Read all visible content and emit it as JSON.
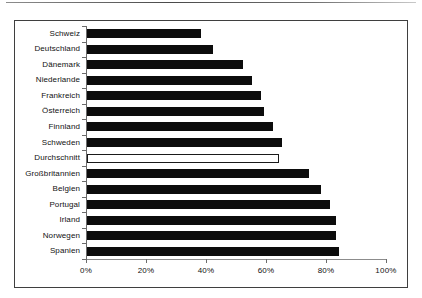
{
  "chart_data": {
    "type": "bar",
    "orientation": "horizontal",
    "title": "",
    "subtitle": "",
    "xlabel": "",
    "ylabel": "",
    "xlim": [
      0,
      100
    ],
    "xtick_labels": [
      "0%",
      "20%",
      "40%",
      "60%",
      "80%",
      "100%"
    ],
    "xticks": [
      0,
      20,
      40,
      60,
      80,
      100
    ],
    "grid": false,
    "legend": null,
    "categories": [
      "Schweiz",
      "Deutschland",
      "Dänemark",
      "Niederlande",
      "Frankreich",
      "Österreich",
      "Finnland",
      "Schweden",
      "Durchschnitt",
      "Großbritannien",
      "Belgien",
      "Portugal",
      "Irland",
      "Norwegen",
      "Spanien"
    ],
    "values": [
      38,
      42,
      52,
      55,
      58,
      59,
      62,
      65,
      64,
      74,
      78,
      81,
      83,
      83,
      84
    ],
    "bar_styles": [
      "filled",
      "filled",
      "filled",
      "filled",
      "filled",
      "filled",
      "filled",
      "filled",
      "hollow",
      "filled",
      "filled",
      "filled",
      "filled",
      "filled",
      "filled"
    ],
    "colors": {
      "bar_fill": "#0c0c0c",
      "bar_highlight_fill": "#ffffff",
      "bar_highlight_stroke": "#1a1a1a",
      "axis": "#6b6b6b",
      "frame": "#3f3f3f",
      "text": "#111111",
      "background": "#ffffff"
    }
  }
}
